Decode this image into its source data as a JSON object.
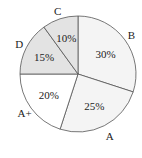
{
  "chart_data": {
    "type": "pie",
    "title": "",
    "categories": [
      "B",
      "A",
      "A+",
      "D",
      "C"
    ],
    "values": [
      30,
      25,
      20,
      15,
      10
    ],
    "value_labels": [
      "30%",
      "25%",
      "20%",
      "15%",
      "10%"
    ],
    "colors": [
      "#f4f4f4",
      "#f4f4f4",
      "#ffffff",
      "#e3e3e3",
      "#e3e3e3"
    ],
    "start_angle_deg": -90,
    "direction": "clockwise",
    "legend": "none"
  }
}
